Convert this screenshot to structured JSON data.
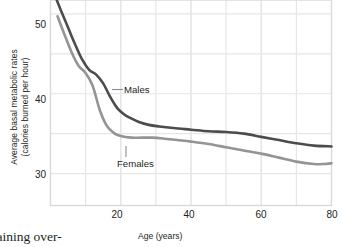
{
  "chart_data": {
    "type": "line",
    "title": "",
    "xlabel": "Age (years)",
    "ylabel_line1": "Average basal metabolic rates",
    "ylabel_line2": "(calories burned per hour)",
    "xlim": [
      0,
      80
    ],
    "ylim": [
      26,
      54
    ],
    "xticks": [
      20,
      40,
      60,
      80
    ],
    "yticks": [
      30,
      40,
      50
    ],
    "xgrid_minor": [
      10,
      20,
      30,
      40,
      50,
      60,
      70
    ],
    "ygrid_minor": [
      30,
      35,
      40,
      45,
      50
    ],
    "grid": true,
    "legend_position": "inline-annotation",
    "series": [
      {
        "name": "Males",
        "color": "#4c4c4c",
        "x": [
          1,
          3,
          5,
          7,
          9,
          11,
          13,
          15,
          17,
          19,
          21,
          23,
          25,
          28,
          31,
          35,
          40,
          45,
          50,
          55,
          60,
          65,
          70,
          75,
          80
        ],
        "values": [
          52.6,
          50.4,
          48.3,
          46.2,
          44.3,
          43.0,
          42.4,
          41.3,
          39.6,
          38.2,
          37.4,
          36.9,
          36.5,
          36.1,
          35.9,
          35.7,
          35.5,
          35.3,
          35.2,
          35.0,
          34.6,
          34.2,
          33.8,
          33.5,
          33.4
        ]
      },
      {
        "name": "Females",
        "color": "#949494",
        "x": [
          2,
          4,
          6,
          8,
          10,
          12,
          14,
          16,
          18,
          20,
          23,
          26,
          29,
          32,
          36,
          40,
          45,
          50,
          55,
          60,
          65,
          70,
          75,
          78,
          80
        ],
        "values": [
          49.7,
          47.4,
          45.2,
          43.5,
          42.6,
          41.0,
          38.0,
          36.0,
          35.1,
          34.7,
          34.5,
          34.5,
          34.5,
          34.4,
          34.2,
          34.0,
          33.7,
          33.3,
          32.9,
          32.5,
          32.0,
          31.5,
          31.2,
          31.2,
          31.3
        ]
      }
    ],
    "annotations": [
      {
        "text": "Males",
        "series": "Males",
        "leader": "horizontal"
      },
      {
        "text": "Females",
        "series": "Females",
        "leader": "vertical"
      }
    ]
  },
  "axis": {
    "y_title_line1": "Average basal metabolic rates",
    "y_title_line2": "(calories burned per hour)",
    "x_title": "Age (years)",
    "y_tick_labels": [
      "50",
      "40",
      "30"
    ],
    "x_tick_labels": [
      "20",
      "40",
      "60",
      "80"
    ]
  },
  "labels": {
    "males": "Males",
    "females": "Females"
  },
  "page": {
    "body_text_fragment": "maining over-"
  }
}
